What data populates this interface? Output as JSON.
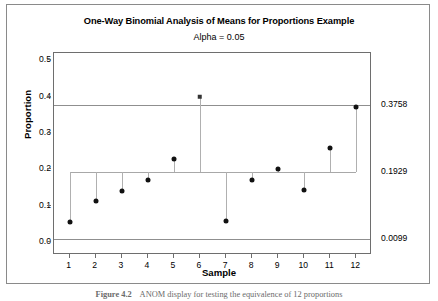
{
  "figure": {
    "caption_label": "Figure 4.2",
    "caption_text": "ANOM display for testing the equivalence of 12 proportions"
  },
  "chart_data": {
    "type": "scatter",
    "title": "One-Way Binomial Analysis of Means for Proportions Example",
    "subtitle": "Alpha = 0.05",
    "xlabel": "Sample",
    "ylabel": "Proportion",
    "xlim": [
      0.4,
      12.6
    ],
    "ylim": [
      -0.035,
      0.52
    ],
    "yticks": [
      0.0,
      0.1,
      0.2,
      0.3,
      0.4,
      0.5
    ],
    "ytick_labels": [
      "0.0",
      "0.1",
      "0.2",
      "0.3",
      "0.4",
      "0.5"
    ],
    "categories": [
      1,
      2,
      3,
      4,
      5,
      6,
      7,
      8,
      9,
      10,
      11,
      12
    ],
    "xtick_labels": [
      "1",
      "2",
      "3",
      "4",
      "5",
      "6",
      "7",
      "8",
      "9",
      "10",
      "11",
      "12"
    ],
    "values": [
      0.056,
      0.112,
      0.142,
      0.172,
      0.228,
      0.4,
      0.058,
      0.172,
      0.201,
      0.144,
      0.26,
      0.373
    ],
    "point_markers": [
      "circle",
      "circle",
      "circle",
      "circle",
      "circle",
      "square",
      "circle",
      "circle",
      "circle",
      "circle",
      "circle",
      "circle"
    ],
    "center_line": {
      "value": 0.1929,
      "label": "0.1929"
    },
    "upper_decision_limit": {
      "value": 0.3758,
      "label": "0.3758"
    },
    "lower_decision_limit": {
      "value": 0.0099,
      "label": "0.0099"
    },
    "grid": false,
    "legend": "none",
    "alpha": 0.05,
    "colors": {
      "marker": "#111111",
      "out_of_limit_marker": "#333333",
      "limit_line": "#8f8f8f",
      "center_line": "#a8a8a8",
      "stem": "#b0b0b0",
      "axis": "#6e6e6e"
    }
  }
}
